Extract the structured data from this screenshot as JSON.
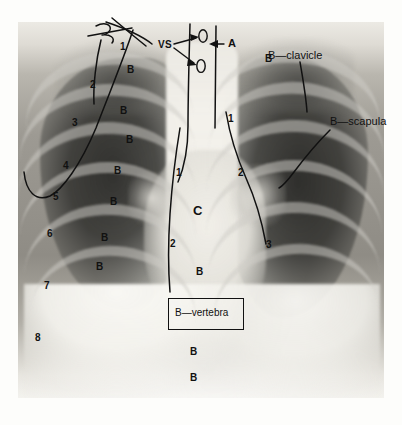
{
  "figure": {
    "kind": "annotated-chest-radiograph",
    "view": "posteroanterior-chest-x-ray"
  },
  "annotations": {
    "lead_labels": [
      {
        "name": "clavicle",
        "text": "B—clavicle",
        "x": 268,
        "y": 56
      },
      {
        "name": "scapula",
        "text": "B—scapula",
        "x": 330,
        "y": 122
      },
      {
        "name": "vertebra",
        "text": "B—vertebra",
        "x": 174,
        "y": 307
      }
    ],
    "letter_marks": [
      {
        "name": "vs",
        "text": "VS",
        "x": 160,
        "y": 44
      },
      {
        "name": "a",
        "text": "A",
        "x": 231,
        "y": 42
      },
      {
        "name": "c",
        "text": "C",
        "x": 196,
        "y": 210
      }
    ],
    "bone_marks": [
      {
        "text": "B",
        "x": 127,
        "y": 69
      },
      {
        "text": "B",
        "x": 120,
        "y": 110
      },
      {
        "text": "B",
        "x": 126,
        "y": 139
      },
      {
        "text": "B",
        "x": 114,
        "y": 170
      },
      {
        "text": "B",
        "x": 110,
        "y": 201
      },
      {
        "text": "B",
        "x": 265,
        "y": 58
      },
      {
        "text": "B",
        "x": 101,
        "y": 237
      },
      {
        "text": "B",
        "x": 96,
        "y": 266
      },
      {
        "text": "B",
        "x": 199,
        "y": 271
      },
      {
        "text": "B",
        "x": 190,
        "y": 351
      },
      {
        "text": "B",
        "x": 190,
        "y": 377
      },
      {
        "text": "B.",
        "x": 330,
        "y": 122
      }
    ],
    "rib_numbers_left": [
      {
        "text": "1",
        "x": 120,
        "y": 46
      },
      {
        "text": "2",
        "x": 90,
        "y": 84
      },
      {
        "text": "3",
        "x": 72,
        "y": 122
      },
      {
        "text": "4",
        "x": 63,
        "y": 165
      },
      {
        "text": "5",
        "x": 53,
        "y": 196
      },
      {
        "text": "6",
        "x": 47,
        "y": 233
      },
      {
        "text": "7",
        "x": 44,
        "y": 285
      },
      {
        "text": "8",
        "x": 35,
        "y": 337
      }
    ],
    "cardiac_numbers_right": [
      {
        "text": "1",
        "x": 228,
        "y": 118
      },
      {
        "text": "2",
        "x": 238,
        "y": 172
      },
      {
        "text": "3",
        "x": 266,
        "y": 244
      }
    ],
    "cardiac_numbers_center": [
      {
        "text": "1",
        "x": 176,
        "y": 172
      },
      {
        "text": "2",
        "x": 170,
        "y": 243
      }
    ],
    "scribble": {
      "name": "handwritten-mark",
      "text": "3",
      "x": 100,
      "y": 30
    }
  },
  "colors": {
    "ink": "#111111",
    "page_background": "#fdfdfb",
    "film_mid": "#9a9a94",
    "film_light": "#ecebe5"
  }
}
